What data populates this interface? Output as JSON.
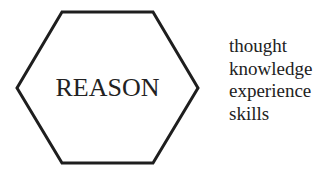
{
  "diagram": {
    "shape": "hexagon",
    "label": "REASON",
    "stroke_color": "#1e1e1e",
    "fill_color": "#ffffff",
    "attributes": [
      "thought",
      "knowledge",
      "experience",
      "skills"
    ]
  }
}
